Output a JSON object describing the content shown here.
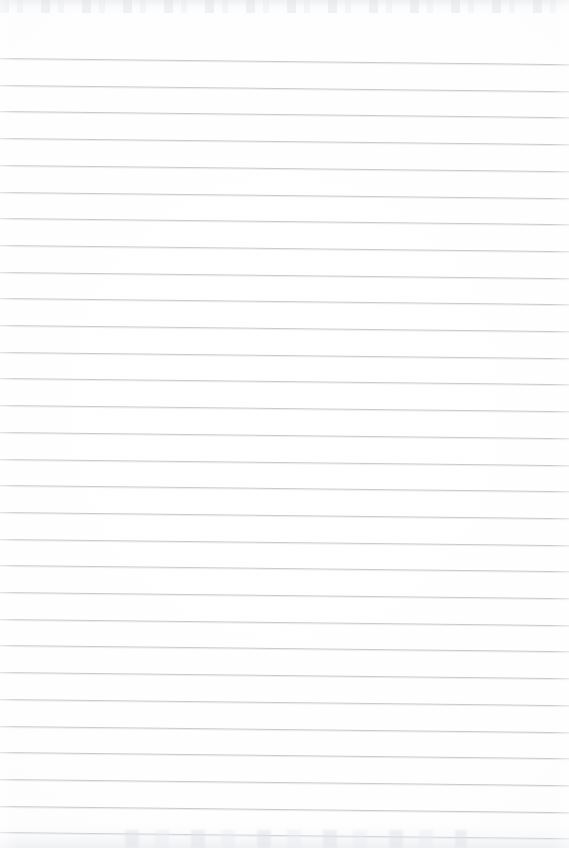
{
  "document": {
    "kind": "scanned-ruled-notebook-page",
    "title": "Blank lined paper",
    "content_text": "",
    "page_width": 569,
    "page_height": 848,
    "has_text": false,
    "has_margin_rule": false,
    "has_header": false,
    "has_page_number": false
  },
  "paper": {
    "background_color": "#ffffff",
    "base_tint_color": "#fdfdfe",
    "edge_smudge_color": "#e4e6ea"
  },
  "ruling": {
    "line_color": "#c9cbcf",
    "line_thickness_px": 1,
    "line_spacing_px": 26.7,
    "first_line_y_px": 58,
    "last_line_y_px": 833,
    "line_count": 30,
    "skew_degrees": 0.62,
    "left_inset_px": 0,
    "right_inset_px": 0,
    "lines": [
      {
        "index": 1,
        "y": 58.0
      },
      {
        "index": 2,
        "y": 84.7
      },
      {
        "index": 3,
        "y": 111.4
      },
      {
        "index": 4,
        "y": 138.1
      },
      {
        "index": 5,
        "y": 164.8
      },
      {
        "index": 6,
        "y": 191.5
      },
      {
        "index": 7,
        "y": 218.2
      },
      {
        "index": 8,
        "y": 244.9
      },
      {
        "index": 9,
        "y": 271.6
      },
      {
        "index": 10,
        "y": 298.3
      },
      {
        "index": 11,
        "y": 325.0
      },
      {
        "index": 12,
        "y": 351.7
      },
      {
        "index": 13,
        "y": 378.4
      },
      {
        "index": 14,
        "y": 405.1
      },
      {
        "index": 15,
        "y": 431.8
      },
      {
        "index": 16,
        "y": 458.5
      },
      {
        "index": 17,
        "y": 485.2
      },
      {
        "index": 18,
        "y": 511.9
      },
      {
        "index": 19,
        "y": 538.6
      },
      {
        "index": 20,
        "y": 565.3
      },
      {
        "index": 21,
        "y": 592.0
      },
      {
        "index": 22,
        "y": 618.7
      },
      {
        "index": 23,
        "y": 645.4
      },
      {
        "index": 24,
        "y": 672.1
      },
      {
        "index": 25,
        "y": 698.8
      },
      {
        "index": 26,
        "y": 725.5
      },
      {
        "index": 27,
        "y": 752.2
      },
      {
        "index": 28,
        "y": 778.9
      },
      {
        "index": 29,
        "y": 805.6
      },
      {
        "index": 30,
        "y": 832.3
      }
    ]
  }
}
